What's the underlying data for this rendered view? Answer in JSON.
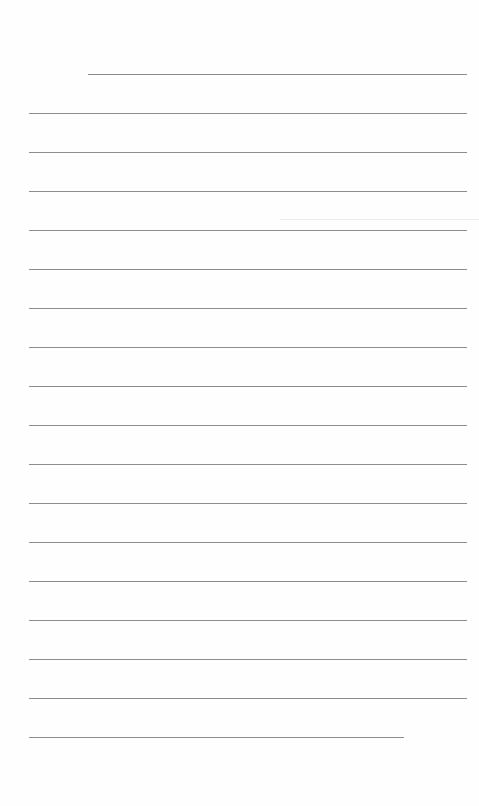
{
  "document": {
    "type": "lined-paper",
    "line_color": "#8c8c8c",
    "background": "#fefefe",
    "line_spacing_px": 39,
    "lines": [
      {
        "x1": 88,
        "x2": 467,
        "y": 74
      },
      {
        "x1": 29,
        "x2": 467,
        "y": 113
      },
      {
        "x1": 29,
        "x2": 467,
        "y": 152
      },
      {
        "x1": 29,
        "x2": 467,
        "y": 191
      },
      {
        "x1": 29,
        "x2": 467,
        "y": 230
      },
      {
        "x1": 29,
        "x2": 467,
        "y": 269
      },
      {
        "x1": 29,
        "x2": 467,
        "y": 308
      },
      {
        "x1": 29,
        "x2": 467,
        "y": 347
      },
      {
        "x1": 29,
        "x2": 467,
        "y": 386
      },
      {
        "x1": 29,
        "x2": 467,
        "y": 425
      },
      {
        "x1": 29,
        "x2": 467,
        "y": 464
      },
      {
        "x1": 29,
        "x2": 467,
        "y": 503
      },
      {
        "x1": 29,
        "x2": 467,
        "y": 542
      },
      {
        "x1": 29,
        "x2": 467,
        "y": 581
      },
      {
        "x1": 29,
        "x2": 467,
        "y": 620
      },
      {
        "x1": 29,
        "x2": 467,
        "y": 659
      },
      {
        "x1": 29,
        "x2": 467,
        "y": 698
      },
      {
        "x1": 29,
        "x2": 404,
        "y": 737
      }
    ]
  }
}
